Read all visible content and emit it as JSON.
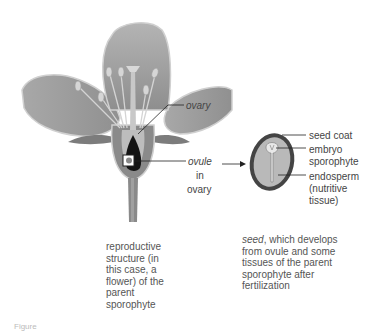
{
  "figure": {
    "flower": {
      "labels": {
        "ovary": "ovary",
        "ovule_line1": "ovule",
        "ovule_line2": "in",
        "ovule_line3": "ovary"
      },
      "description_lines": [
        "reproductive",
        "structure (in",
        "this case, a",
        "flower) of the",
        "parent",
        "sporophyte"
      ]
    },
    "seed": {
      "labels": {
        "seed_coat": "seed coat",
        "embryo_line1": "embryo",
        "embryo_line2": "sporophyte",
        "endosperm_line1": "endosperm",
        "endosperm_line2": "(nutritive",
        "endosperm_line3": "tissue)"
      },
      "description": {
        "term": "seed",
        "lines": [
          ", which develops",
          "from ovule and some",
          "tissues of the parent",
          "sporophyte after",
          "fertilization"
        ]
      }
    },
    "caption_fragment": "Figure"
  },
  "colors": {
    "petal": "#9a9a9a",
    "petal_light": "#c4c4c4",
    "petal_edge": "#d8d8d8",
    "dark": "#1a1a1a",
    "seed_coat": "#4a4a4a",
    "endosperm": "#b8b8b8",
    "line": "#333333"
  }
}
